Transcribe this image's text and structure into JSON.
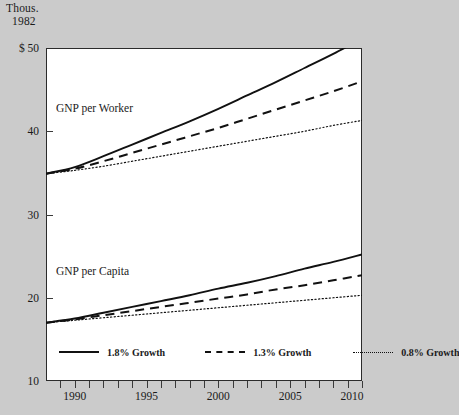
{
  "axis_unit": {
    "line1": "Thous.",
    "line2": "1982"
  },
  "series_labels": {
    "worker": "GNP per Worker",
    "capita": "GNP per Capita"
  },
  "legend": {
    "items": [
      {
        "label": "1.8% Growth",
        "style": "solid"
      },
      {
        "label": "1.3% Growth",
        "style": "dashed"
      },
      {
        "label": "0.8% Growth",
        "style": "dotted"
      }
    ]
  },
  "chart_data": {
    "type": "line",
    "title": "",
    "xlabel": "",
    "ylabel": "Thous. 1982 $",
    "xlim": [
      1988,
      2010
    ],
    "ylim": [
      10,
      50
    ],
    "grid": false,
    "legend_position": "bottom-inside",
    "ytick_labels": [
      "$ 50",
      "40",
      "30",
      "20",
      "10"
    ],
    "ytick_values": [
      50,
      40,
      30,
      20,
      10
    ],
    "xtick_labels": [
      "1990",
      "1995",
      "2000",
      "2005",
      "2010"
    ],
    "xtick_values": [
      1990,
      1995,
      2000,
      2005,
      2010
    ],
    "xtick_minor": [
      1988,
      1989,
      1991,
      1992,
      1993,
      1994,
      1996,
      1997,
      1998,
      1999,
      2001,
      2002,
      2003,
      2004,
      2006,
      2007,
      2008,
      2009
    ],
    "x": [
      1988,
      1990,
      1992,
      1994,
      1996,
      1998,
      2000,
      2002,
      2004,
      2006,
      2008,
      2010
    ],
    "series": [
      {
        "name": "GNP per Worker, 1.8% Growth",
        "group": "GNP per Worker",
        "style": "solid",
        "values": [
          34.9,
          35.7,
          37.0,
          38.4,
          39.8,
          41.2,
          42.7,
          44.3,
          45.9,
          47.6,
          49.3,
          51.1
        ]
      },
      {
        "name": "GNP per Worker, 1.3% Growth",
        "group": "GNP per Worker",
        "style": "dashed",
        "values": [
          34.9,
          35.5,
          36.4,
          37.4,
          38.4,
          39.4,
          40.4,
          41.5,
          42.6,
          43.7,
          44.8,
          46.0
        ]
      },
      {
        "name": "GNP per Worker, 0.8% Growth",
        "group": "GNP per Worker",
        "style": "dotted",
        "values": [
          34.9,
          35.3,
          35.8,
          36.4,
          37.0,
          37.6,
          38.2,
          38.8,
          39.4,
          40.0,
          40.7,
          41.3
        ]
      },
      {
        "name": "GNP per Capita, 1.8% Growth",
        "group": "GNP per Capita",
        "style": "solid",
        "values": [
          17.0,
          17.5,
          18.2,
          18.9,
          19.6,
          20.3,
          21.1,
          21.8,
          22.6,
          23.5,
          24.3,
          25.2
        ]
      },
      {
        "name": "GNP per Capita, 1.3% Growth",
        "group": "GNP per Capita",
        "style": "dashed",
        "values": [
          17.0,
          17.4,
          17.9,
          18.4,
          18.9,
          19.4,
          19.9,
          20.4,
          21.0,
          21.5,
          22.1,
          22.7
        ]
      },
      {
        "name": "GNP per Capita, 0.8% Growth",
        "group": "GNP per Capita",
        "style": "dotted",
        "values": [
          17.0,
          17.3,
          17.6,
          17.9,
          18.2,
          18.5,
          18.8,
          19.1,
          19.4,
          19.7,
          20.0,
          20.3
        ]
      }
    ]
  }
}
